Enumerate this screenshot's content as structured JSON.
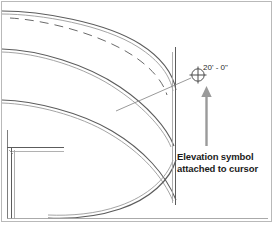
{
  "figure": {
    "name": "revit-elevation-symbol-placement",
    "background_color": "#ffffff",
    "border_color": "#b9b9b9"
  },
  "callout": {
    "line1": "Elevation symbol",
    "line2": "attached to cursor",
    "text_color": "#1b1b1b",
    "arrow_color": "#9a9a9a"
  },
  "elevation_symbol": {
    "label": "20' - 0\"",
    "label_color": "#2a2a2a",
    "symbol_name": "elevation-marker-crosshair-circle",
    "stroke_color": "#4a4a4a"
  },
  "drawing": {
    "line_color_dark": "#5c5c5c",
    "line_color_mid": "#8a8a8a",
    "line_color_light": "#b5b5b5",
    "leader_color": "#8f8f8f",
    "description": "curved wall plan with dashed upper arc, wall corner at left, lower floor line"
  }
}
